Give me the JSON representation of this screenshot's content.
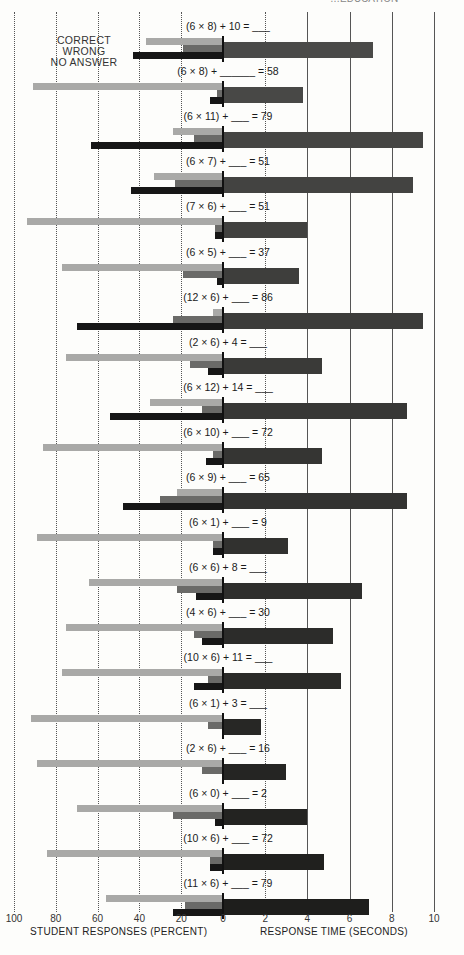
{
  "header": {
    "running_head_fragment": "…EDUCATION",
    "page_number_fragment": "2 1 3"
  },
  "legend": {
    "items": [
      "CORRECT",
      "WRONG",
      "NO ANSWER"
    ]
  },
  "axes": {
    "left_title": "STUDENT RESPONSES (PERCENT)",
    "right_title": "RESPONSE TIME (SECONDS)",
    "left_ticks": [
      "100",
      "80",
      "60",
      "40",
      "20",
      "0"
    ],
    "right_ticks": [
      "2",
      "4",
      "6",
      "8",
      "10"
    ]
  },
  "colors": {
    "correct": "#a9a9a7",
    "wrong": "#6a6a68",
    "no_answer": "#161616",
    "time_top": "#4a4a48",
    "time_bottom": "#1e1e1e",
    "gridline": "#555555"
  },
  "chart_data": {
    "type": "bar",
    "orientation": "horizontal",
    "title": "",
    "layout": "butterfly: stacked-row percent bars extend left from 0; response-time bar extends right from 0",
    "categories": [
      "(6 × 8) + 10 = ___",
      "(6 × 8) + ______ = 58",
      "(6 × 11) + ___ = 79",
      "(6 × 7) + ___ = 51",
      "(7 × 6) + ___ = 51",
      "(6 × 5) + ___ = 37",
      "(12 × 6) + ___ = 86",
      "(2 × 6) + 4 = ___",
      "(6 × 12) + 14 = ___",
      "(6 × 10) + ___ = 72",
      "(6 × 9) + ___ = 65",
      "(6 × 1) + ___ = 9",
      "(6 × 6) + 8 = ___",
      "(4 × 6) + ___ = 30",
      "(10 × 6) + 11 = ___",
      "(6 × 1) + 3 = ___",
      "(2 × 6) + ___ = 16",
      "(6 × 0) + ___ = 2",
      "(10 × 6) + ___ = 72",
      "(11 × 6) + ___ = 79"
    ],
    "series": [
      {
        "name": "CORRECT",
        "axis": "left",
        "unit": "percent",
        "values": [
          37,
          91,
          24,
          33,
          94,
          77,
          5,
          75,
          35,
          86,
          22,
          89,
          64,
          75,
          77,
          92,
          89,
          70,
          84,
          56
        ]
      },
      {
        "name": "WRONG",
        "axis": "left",
        "unit": "percent",
        "values": [
          19,
          3,
          14,
          23,
          4,
          19,
          24,
          16,
          10,
          5,
          30,
          5,
          22,
          14,
          7,
          7,
          10,
          24,
          6,
          18
        ]
      },
      {
        "name": "NO ANSWER",
        "axis": "left",
        "unit": "percent",
        "values": [
          43,
          6,
          63,
          44,
          4,
          3,
          70,
          7,
          54,
          8,
          48,
          5,
          13,
          10,
          14,
          0,
          0,
          4,
          6,
          24
        ]
      },
      {
        "name": "RESPONSE TIME",
        "axis": "right",
        "unit": "seconds",
        "values": [
          7.1,
          3.8,
          9.5,
          9.0,
          4.0,
          3.6,
          9.5,
          4.7,
          8.7,
          4.7,
          8.7,
          3.1,
          6.6,
          5.2,
          5.6,
          1.8,
          3.0,
          4.0,
          4.8,
          6.9
        ]
      }
    ],
    "xlabel_left": "STUDENT RESPONSES (PERCENT)",
    "xlabel_right": "RESPONSE TIME (SECONDS)",
    "xlim_left": [
      100,
      0
    ],
    "xlim_right": [
      0,
      10
    ],
    "left_ticks": [
      100,
      80,
      60,
      40,
      20,
      0
    ],
    "right_ticks": [
      0,
      2,
      4,
      6,
      8,
      10
    ],
    "grid": true,
    "legend_position": "upper-left (text labels stacked beside first row bars)"
  }
}
